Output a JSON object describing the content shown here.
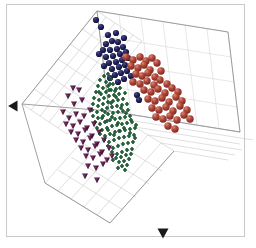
{
  "figure": {
    "title": "",
    "background_color": "#ffffff",
    "border_color": "#c9c9c9",
    "grid_color": "#bfbfbf",
    "frame_color": "#9a9a9a"
  },
  "chart_data": {
    "type": "scatter",
    "projection": "3d",
    "title": "",
    "xlabel": "",
    "ylabel": "",
    "zlabel": "",
    "xlim": [
      0,
      1
    ],
    "ylim": [
      0,
      1
    ],
    "zlim": [
      0,
      1
    ],
    "grid": true,
    "legend_position": "none",
    "axis_tick_labels": [],
    "annotations": [
      {
        "name": "left-axis-arrow",
        "x": 12,
        "y": 106,
        "color": "#1a1a1a",
        "shape": "triangle-left"
      },
      {
        "name": "bottom-axis-arrow",
        "x": 163,
        "y": 234,
        "color": "#1a1a1a",
        "shape": "triangle-down"
      }
    ],
    "series": [
      {
        "name": "cluster-navy",
        "color": "#1b1b4f",
        "marker": "circle-3d",
        "marker_size": 6.2,
        "count": 34,
        "points": [
          [
            96,
            20
          ],
          [
            101,
            27
          ],
          [
            108,
            35
          ],
          [
            116,
            33
          ],
          [
            112,
            41
          ],
          [
            106,
            44
          ],
          [
            118,
            42
          ],
          [
            124,
            38
          ],
          [
            103,
            50
          ],
          [
            110,
            50
          ],
          [
            117,
            49
          ],
          [
            123,
            47
          ],
          [
            99,
            54
          ],
          [
            106,
            57
          ],
          [
            113,
            56
          ],
          [
            120,
            54
          ],
          [
            126,
            52
          ],
          [
            109,
            63
          ],
          [
            116,
            62
          ],
          [
            122,
            60
          ],
          [
            128,
            58
          ],
          [
            104,
            66
          ],
          [
            112,
            69
          ],
          [
            119,
            67
          ],
          [
            125,
            65
          ],
          [
            115,
            75
          ],
          [
            121,
            73
          ],
          [
            127,
            71
          ],
          [
            110,
            78
          ],
          [
            118,
            82
          ],
          [
            124,
            79
          ],
          [
            131,
            76
          ],
          [
            137,
            95
          ],
          [
            139,
            100
          ]
        ]
      },
      {
        "name": "cluster-red",
        "color": "#a7392f",
        "marker": "circle-3d",
        "marker_size": 7.4,
        "count": 47,
        "points": [
          [
            126,
            57
          ],
          [
            133,
            60
          ],
          [
            140,
            57
          ],
          [
            146,
            61
          ],
          [
            152,
            58
          ],
          [
            131,
            66
          ],
          [
            138,
            68
          ],
          [
            144,
            65
          ],
          [
            150,
            70
          ],
          [
            157,
            63
          ],
          [
            136,
            74
          ],
          [
            142,
            76
          ],
          [
            148,
            73
          ],
          [
            155,
            77
          ],
          [
            161,
            71
          ],
          [
            133,
            82
          ],
          [
            140,
            84
          ],
          [
            147,
            81
          ],
          [
            154,
            85
          ],
          [
            160,
            80
          ],
          [
            167,
            84
          ],
          [
            144,
            90
          ],
          [
            151,
            92
          ],
          [
            158,
            89
          ],
          [
            165,
            93
          ],
          [
            172,
            88
          ],
          [
            178,
            92
          ],
          [
            148,
            99
          ],
          [
            155,
            101
          ],
          [
            162,
            98
          ],
          [
            169,
            102
          ],
          [
            176,
            97
          ],
          [
            182,
            101
          ],
          [
            152,
            108
          ],
          [
            159,
            110
          ],
          [
            166,
            107
          ],
          [
            173,
            111
          ],
          [
            180,
            106
          ],
          [
            187,
            110
          ],
          [
            156,
            117
          ],
          [
            163,
            119
          ],
          [
            170,
            116
          ],
          [
            177,
            120
          ],
          [
            184,
            115
          ],
          [
            190,
            119
          ],
          [
            168,
            126
          ],
          [
            175,
            129
          ]
        ]
      },
      {
        "name": "cluster-green",
        "color": "#1f5c34",
        "marker": "plus",
        "marker_size": 4.0,
        "count": 120,
        "points": [
          [
            104,
            76
          ],
          [
            108,
            74
          ],
          [
            100,
            80
          ],
          [
            106,
            82
          ],
          [
            111,
            79
          ],
          [
            98,
            86
          ],
          [
            103,
            88
          ],
          [
            108,
            86
          ],
          [
            113,
            84
          ],
          [
            96,
            92
          ],
          [
            101,
            94
          ],
          [
            106,
            92
          ],
          [
            111,
            90
          ],
          [
            116,
            89
          ],
          [
            94,
            98
          ],
          [
            99,
            100
          ],
          [
            104,
            98
          ],
          [
            109,
            96
          ],
          [
            114,
            95
          ],
          [
            119,
            94
          ],
          [
            93,
            104
          ],
          [
            98,
            106
          ],
          [
            103,
            104
          ],
          [
            108,
            102
          ],
          [
            113,
            101
          ],
          [
            118,
            100
          ],
          [
            123,
            99
          ],
          [
            92,
            110
          ],
          [
            97,
            112
          ],
          [
            102,
            110
          ],
          [
            107,
            108
          ],
          [
            112,
            107
          ],
          [
            117,
            106
          ],
          [
            122,
            105
          ],
          [
            127,
            104
          ],
          [
            93,
            116
          ],
          [
            98,
            118
          ],
          [
            103,
            116
          ],
          [
            108,
            114
          ],
          [
            113,
            113
          ],
          [
            118,
            112
          ],
          [
            123,
            111
          ],
          [
            128,
            110
          ],
          [
            95,
            122
          ],
          [
            100,
            124
          ],
          [
            105,
            122
          ],
          [
            110,
            120
          ],
          [
            115,
            119
          ],
          [
            120,
            118
          ],
          [
            125,
            117
          ],
          [
            130,
            116
          ],
          [
            97,
            128
          ],
          [
            102,
            130
          ],
          [
            107,
            128
          ],
          [
            112,
            126
          ],
          [
            117,
            125
          ],
          [
            122,
            124
          ],
          [
            127,
            123
          ],
          [
            132,
            122
          ],
          [
            100,
            134
          ],
          [
            105,
            136
          ],
          [
            110,
            134
          ],
          [
            115,
            132
          ],
          [
            120,
            131
          ],
          [
            125,
            130
          ],
          [
            130,
            129
          ],
          [
            135,
            128
          ],
          [
            104,
            140
          ],
          [
            109,
            142
          ],
          [
            114,
            140
          ],
          [
            119,
            138
          ],
          [
            124,
            137
          ],
          [
            129,
            136
          ],
          [
            134,
            135
          ],
          [
            108,
            146
          ],
          [
            113,
            148
          ],
          [
            118,
            146
          ],
          [
            123,
            144
          ],
          [
            128,
            143
          ],
          [
            133,
            142
          ],
          [
            112,
            152
          ],
          [
            117,
            154
          ],
          [
            122,
            152
          ],
          [
            127,
            150
          ],
          [
            132,
            149
          ],
          [
            116,
            158
          ],
          [
            121,
            157
          ],
          [
            126,
            155
          ],
          [
            131,
            154
          ],
          [
            119,
            162
          ],
          [
            124,
            161
          ],
          [
            129,
            159
          ],
          [
            122,
            166
          ],
          [
            127,
            165
          ],
          [
            110,
            84
          ],
          [
            115,
            91
          ],
          [
            120,
            88
          ],
          [
            125,
            93
          ],
          [
            102,
            118
          ],
          [
            107,
            121
          ],
          [
            112,
            117
          ],
          [
            118,
            123
          ],
          [
            124,
            128
          ],
          [
            130,
            133
          ],
          [
            135,
            138
          ],
          [
            108,
            130
          ],
          [
            114,
            135
          ],
          [
            119,
            131
          ],
          [
            105,
            112
          ],
          [
            111,
            103
          ],
          [
            116,
            97
          ],
          [
            121,
            108
          ],
          [
            126,
            113
          ],
          [
            131,
            120
          ],
          [
            136,
            125
          ],
          [
            99,
            92
          ],
          [
            109,
            90
          ],
          [
            113,
            160
          ],
          [
            118,
            168
          ],
          [
            125,
            170
          ]
        ]
      },
      {
        "name": "cluster-purple",
        "color": "#4c1342",
        "marker": "triangle-down",
        "marker_size": 6.0,
        "count": 40,
        "points": [
          [
            73,
            88
          ],
          [
            79,
            90
          ],
          [
            68,
            96
          ],
          [
            74,
            104
          ],
          [
            82,
            100
          ],
          [
            63,
            112
          ],
          [
            69,
            118
          ],
          [
            76,
            114
          ],
          [
            84,
            116
          ],
          [
            90,
            110
          ],
          [
            66,
            124
          ],
          [
            73,
            126
          ],
          [
            80,
            122
          ],
          [
            87,
            128
          ],
          [
            94,
            124
          ],
          [
            71,
            132
          ],
          [
            78,
            134
          ],
          [
            85,
            130
          ],
          [
            92,
            136
          ],
          [
            99,
            132
          ],
          [
            76,
            140
          ],
          [
            83,
            142
          ],
          [
            90,
            138
          ],
          [
            97,
            144
          ],
          [
            104,
            140
          ],
          [
            81,
            148
          ],
          [
            88,
            150
          ],
          [
            95,
            146
          ],
          [
            102,
            152
          ],
          [
            109,
            148
          ],
          [
            86,
            156
          ],
          [
            93,
            158
          ],
          [
            100,
            154
          ],
          [
            107,
            160
          ],
          [
            88,
            166
          ],
          [
            96,
            168
          ],
          [
            103,
            164
          ],
          [
            85,
            176
          ],
          [
            97,
            180
          ],
          [
            112,
            156
          ]
        ]
      }
    ]
  }
}
